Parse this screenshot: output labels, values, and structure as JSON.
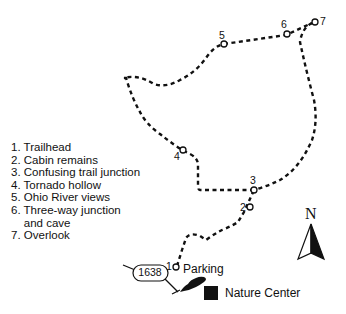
{
  "legend": {
    "items": [
      "1. Trailhead",
      "2. Cabin remains",
      "3. Confusing trail junction",
      "4. Tornado hollow",
      "5. Ohio River views",
      "6. Three-way junction",
      "    and cave",
      "7. Overlook"
    ]
  },
  "waypoints": [
    {
      "number": "1",
      "name": "Trailhead"
    },
    {
      "number": "2",
      "name": "Cabin remains"
    },
    {
      "number": "3",
      "name": "Confusing trail junction"
    },
    {
      "number": "4",
      "name": "Tornado hollow"
    },
    {
      "number": "5",
      "name": "Ohio River views"
    },
    {
      "number": "6",
      "name": "Three-way junction and cave"
    },
    {
      "number": "7",
      "name": "Overlook"
    }
  ],
  "labels": {
    "parking": "Parking",
    "nature_center": "Nature Center",
    "route": "1638",
    "north": "N"
  },
  "colors": {
    "trail": "#111111",
    "background": "#ffffff"
  }
}
